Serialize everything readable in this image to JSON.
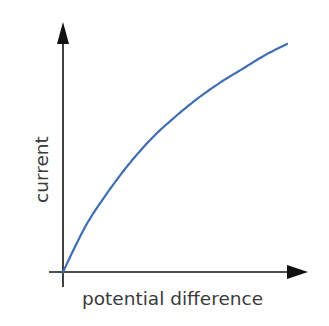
{
  "chart_data": {
    "type": "line",
    "title": "",
    "xlabel": "potential difference",
    "ylabel": "current",
    "grid": false,
    "legend": null,
    "axis_ticks": false,
    "series": [
      {
        "name": "current vs potential difference",
        "color": "#3f6db3",
        "x": [
          0,
          0.1,
          0.2,
          0.3,
          0.4,
          0.5,
          0.6,
          0.7,
          0.8,
          0.9,
          1.0
        ],
        "y": [
          0,
          0.2,
          0.35,
          0.48,
          0.59,
          0.68,
          0.76,
          0.83,
          0.89,
          0.95,
          1.0
        ]
      }
    ],
    "xlim": [
      0,
      1.1
    ],
    "ylim": [
      0,
      1.1
    ]
  },
  "colors": {
    "axis": "#111111",
    "curve": "#3f6db3",
    "label": "#3a3a3a"
  }
}
